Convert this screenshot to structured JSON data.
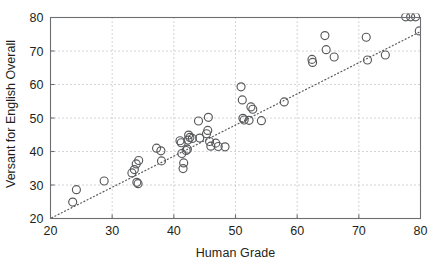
{
  "chart_data": {
    "type": "scatter",
    "title": "",
    "xlabel": "Human Grade",
    "ylabel": "Versant for English Overall",
    "xlim": [
      20,
      80
    ],
    "ylim": [
      20,
      80
    ],
    "xticks": [
      20,
      30,
      40,
      50,
      60,
      70,
      80
    ],
    "yticks": [
      20,
      30,
      40,
      50,
      60,
      70,
      80
    ],
    "grid": true,
    "grid_style": "dotted",
    "legend": null,
    "marker": "open-circle",
    "marker_color": "#58595b",
    "series": [
      {
        "name": "students",
        "points": [
          [
            23.6,
            24.9
          ],
          [
            24.2,
            28.6
          ],
          [
            28.7,
            31.2
          ],
          [
            33.2,
            33.6
          ],
          [
            33.6,
            34.6
          ],
          [
            33.9,
            36.3
          ],
          [
            34.3,
            37.3
          ],
          [
            34.0,
            30.8
          ],
          [
            34.2,
            30.4
          ],
          [
            37.2,
            41.0
          ],
          [
            37.9,
            40.2
          ],
          [
            38.0,
            37.2
          ],
          [
            41.0,
            43.2
          ],
          [
            41.2,
            42.6
          ],
          [
            41.3,
            39.4
          ],
          [
            41.5,
            34.9
          ],
          [
            41.6,
            36.6
          ],
          [
            42.0,
            40.3
          ],
          [
            42.2,
            40.7
          ],
          [
            42.3,
            43.4
          ],
          [
            42.4,
            44.9
          ],
          [
            42.6,
            44.2
          ],
          [
            43.0,
            43.9
          ],
          [
            44.0,
            49.1
          ],
          [
            44.2,
            44.0
          ],
          [
            45.3,
            45.3
          ],
          [
            45.5,
            46.3
          ],
          [
            45.6,
            50.2
          ],
          [
            45.8,
            43.0
          ],
          [
            46.0,
            41.6
          ],
          [
            46.8,
            42.5
          ],
          [
            47.2,
            41.5
          ],
          [
            48.3,
            41.4
          ],
          [
            50.9,
            59.3
          ],
          [
            51.1,
            55.4
          ],
          [
            51.2,
            49.9
          ],
          [
            51.4,
            49.4
          ],
          [
            52.2,
            49.3
          ],
          [
            52.5,
            53.3
          ],
          [
            52.8,
            52.6
          ],
          [
            54.2,
            49.2
          ],
          [
            57.9,
            54.8
          ],
          [
            62.4,
            67.5
          ],
          [
            62.5,
            66.6
          ],
          [
            64.5,
            74.6
          ],
          [
            64.7,
            70.4
          ],
          [
            66.0,
            68.2
          ],
          [
            71.2,
            74.1
          ],
          [
            71.4,
            67.3
          ],
          [
            74.3,
            68.8
          ],
          [
            77.6,
            80.2
          ],
          [
            78.4,
            80.2
          ],
          [
            79.2,
            80.2
          ],
          [
            79.8,
            76.0
          ]
        ]
      }
    ],
    "trendline": {
      "style": "dotted",
      "color": "#58595b",
      "x_start": 20.2,
      "y_start": 20.2,
      "x_end": 80.0,
      "y_end": 75.8
    }
  },
  "axes": {
    "x_tick_labels": [
      "20",
      "30",
      "40",
      "50",
      "60",
      "70",
      "80"
    ],
    "y_tick_labels": [
      "20",
      "30",
      "40",
      "50",
      "60",
      "70",
      "80"
    ]
  }
}
